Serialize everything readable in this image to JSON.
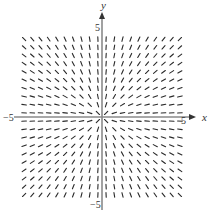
{
  "chart_data": {
    "type": "slope_field",
    "title": "",
    "equation": "dy/dx = y/x",
    "xlabel": "x",
    "ylabel": "y",
    "xlim": [
      -5,
      5
    ],
    "ylim": [
      -5,
      5
    ],
    "grid": false,
    "legend": null,
    "tick_labels": {
      "x_min": "−5",
      "x_max": "5",
      "y_min": "−5",
      "y_max": "5"
    },
    "sample_points": {
      "x": [
        -4.75,
        -4.25,
        -3.75,
        -3.25,
        -2.75,
        -2.25,
        -1.75,
        -1.25,
        -0.75,
        -0.25,
        0.25,
        0.75,
        1.25,
        1.75,
        2.25,
        2.75,
        3.25,
        3.75,
        4.25,
        4.75
      ],
      "y": [
        -4.75,
        -4.25,
        -3.75,
        -3.25,
        -2.75,
        -2.25,
        -1.75,
        -1.25,
        -0.75,
        -0.25,
        0.25,
        0.75,
        1.25,
        1.75,
        2.25,
        2.75,
        3.25,
        3.75,
        4.25,
        4.75
      ]
    },
    "segment_length_units": 0.28
  },
  "layout": {
    "origin_px": [
      102,
      117
    ],
    "px_per_unit": 16.4,
    "x_axis_extent_px": [
      14,
      196
    ],
    "y_axis_extent_px": [
      12,
      210
    ],
    "axis_color": "#8a8a8a",
    "segment_color": "#2a2a2a"
  }
}
